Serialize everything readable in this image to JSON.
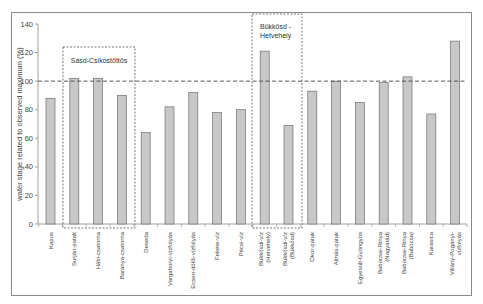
{
  "chart_data": {
    "type": "bar",
    "title": "",
    "xlabel": "",
    "ylabel": "water stage related to observed maximum (%)",
    "ylim": [
      0,
      140
    ],
    "yticks": [
      0,
      20,
      40,
      60,
      80,
      100,
      120,
      140
    ],
    "grid": false,
    "legend": null,
    "categories": [
      "Kapos",
      "Surján-patak",
      "Hábi-csatorna",
      "Baranya-csatorna",
      "Deseda",
      "Vargaboryi-vízfolyás",
      "Ecsen-dölői-vízfolyás",
      "Fekete-víz",
      "Pécsi-víz",
      "Bükkösdi-víz (Hetvehely)",
      "Bükkösdi-víz (Bükkösd)",
      "Okor-patak",
      "Almás-patak",
      "Egyesült-Gyöngyös",
      "Babócsai-Rinya (Nagyatád)",
      "Babócsai-Rinya (Babócsa)",
      "Karasica",
      "Villány-Pogányi-vízfolyás"
    ],
    "category_lines": [
      [
        "Kapos"
      ],
      [
        "Surján-patak"
      ],
      [
        "Hábi-csatorna"
      ],
      [
        "Baranya-csatorna"
      ],
      [
        "Deseda"
      ],
      [
        "Vargaboryi-vízfolyás"
      ],
      [
        "Ecsen-dölői-vízfolyás"
      ],
      [
        "Fekete-víz"
      ],
      [
        "Pécsi-víz"
      ],
      [
        "Bükkösdi-víz",
        "(Hetvehely)"
      ],
      [
        "Bükkösdi-víz",
        "(Bükkösd)"
      ],
      [
        "Okor-patak"
      ],
      [
        "Almás-patak"
      ],
      [
        "Egyesült-Gyöngyös"
      ],
      [
        "Babócsai-Rinya",
        "(Nagyatád)"
      ],
      [
        "Babócsai-Rinya",
        "(Babócsa)"
      ],
      [
        "Karasica"
      ],
      [
        "Villány-Pogányi-",
        "vízfolyás"
      ]
    ],
    "values": [
      88,
      102,
      102,
      90,
      64,
      82,
      92,
      78,
      80,
      121,
      69,
      93,
      100,
      85,
      99,
      103,
      77,
      128
    ],
    "reference_line": {
      "value": 100,
      "style": "dashed"
    },
    "annotations": [
      {
        "label": "Sásd-Csikóstőttős",
        "type": "dashed-box",
        "covers": [
          "Surján-patak",
          "Hábi-csatorna",
          "Baranya-csatorna"
        ]
      },
      {
        "label_lines": [
          "Bükkösd -",
          "Hetvehely"
        ],
        "type": "dashed-box",
        "covers": [
          "Bükkösdi-víz (Hetvehely)",
          "Bükkösdi-víz (Bükkösd)"
        ]
      }
    ],
    "colors": {
      "bar_fill": "#c8c8c8",
      "bar_stroke": "#6f6f6f",
      "axis": "#8a8a8a",
      "reference_line": "#444444"
    }
  }
}
